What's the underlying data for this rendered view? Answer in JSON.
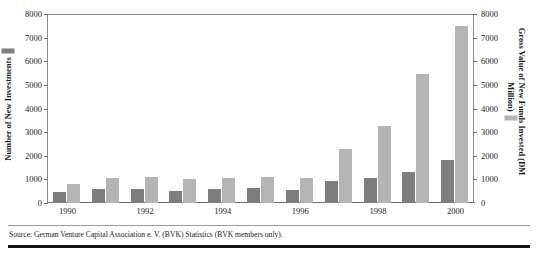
{
  "chart_data": {
    "type": "bar",
    "title": "",
    "subtitle": "",
    "xlabel": "",
    "categories": [
      "1990",
      "1991",
      "1992",
      "1993",
      "1994",
      "1995",
      "1996",
      "1997",
      "1998",
      "1999",
      "2000"
    ],
    "tick_labels_x": [
      "1990",
      "",
      "1992",
      "",
      "1994",
      "",
      "1996",
      "",
      "1998",
      "",
      "2000"
    ],
    "axis_left": {
      "label": "Number of New Investments",
      "ylim": [
        0,
        8000
      ],
      "ticks": [
        0,
        1000,
        2000,
        3000,
        4000,
        5000,
        6000,
        7000,
        8000
      ],
      "tick_labels": [
        "0",
        "1000",
        "2000",
        "3000",
        "4000",
        "5000",
        "6000",
        "7000",
        "8000"
      ]
    },
    "axis_right": {
      "label": "Gross Value of New Funds Invested (DM Million)",
      "ylim": [
        0,
        8000
      ],
      "ticks": [
        0,
        1000,
        2000,
        3000,
        4000,
        5000,
        6000,
        7000,
        8000
      ],
      "tick_labels": [
        "0",
        "1000",
        "2000",
        "3000",
        "4000",
        "5000",
        "6000",
        "7000",
        "8000"
      ]
    },
    "grid": false,
    "legend_position": "axis-titles",
    "series": [
      {
        "name": "Number of New Investments",
        "axis": "left",
        "color": "#7d7d7d",
        "values": [
          450,
          600,
          610,
          520,
          590,
          640,
          570,
          940,
          1080,
          1300,
          1800
        ]
      },
      {
        "name": "Gross Value of New Funds Invested (DM Million)",
        "axis": "right",
        "color": "#b4b4b4",
        "values": [
          810,
          1060,
          1090,
          1000,
          1080,
          1120,
          1050,
          2300,
          3250,
          5450,
          7500
        ]
      }
    ]
  },
  "footer": {
    "source": "Source: German Venture Capital Association e. V. (BVK) Statistics (BVK members only)."
  }
}
